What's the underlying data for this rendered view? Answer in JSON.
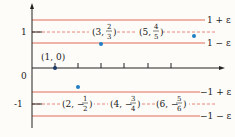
{
  "colors": {
    "band_line": "#e06a5a",
    "axis": "#222222",
    "point": "#1f7fc4",
    "background": "#fdfcf8"
  },
  "axis": {
    "y_tick_labels": [
      "1",
      "0",
      "-1"
    ],
    "x_ticks_count": 6
  },
  "bands": {
    "upper": {
      "top_label": "1 + ε",
      "bottom_label": "1 − ε"
    },
    "lower": {
      "top_label": "−1 + ε",
      "bottom_label": "−1 − ε"
    }
  },
  "points": [
    {
      "label": "(1, 0)",
      "n": 1
    },
    {
      "label_left": "(3,",
      "num": "2",
      "den": "3",
      "n": 3
    },
    {
      "label_left": "(5,",
      "num": "4",
      "den": "5",
      "n": 5
    },
    {
      "label_left": "(2, −",
      "num": "1",
      "den": "2",
      "n": 2
    },
    {
      "label_left": "(4, −",
      "num": "3",
      "den": "4",
      "n": 4
    },
    {
      "label_left": "(6, −",
      "num": "5",
      "den": "6",
      "n": 6
    }
  ]
}
